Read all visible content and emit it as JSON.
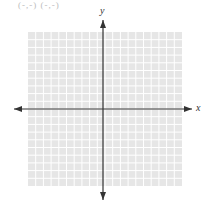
{
  "header": {
    "cropped_text": "(-,-) (-,-)"
  },
  "graph": {
    "x_label": "x",
    "y_label": "y",
    "grid": {
      "left": 28,
      "top": 32,
      "right": 182,
      "bottom": 186,
      "cells": 20,
      "fill": "#e6e6e6",
      "line": "#ffffff"
    },
    "origin": {
      "x": 103,
      "y": 109
    },
    "axis_color": "#333333"
  }
}
